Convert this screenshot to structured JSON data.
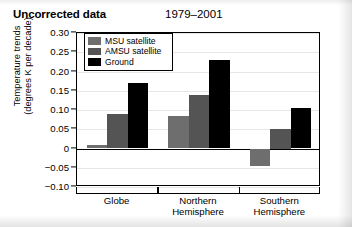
{
  "title": {
    "main": "Uncorrected data",
    "period": "1979–2001"
  },
  "axis": {
    "ylabel_line1": "Temperature trends",
    "ylabel_line2": "(degrees K per decade)"
  },
  "legend": {
    "items": [
      {
        "label": "MSU satellite",
        "color": "#6e6e6e"
      },
      {
        "label": "AMSU satellite",
        "color": "#545454"
      },
      {
        "label": "Ground",
        "color": "#000000"
      }
    ]
  },
  "chart_data": {
    "type": "bar",
    "title": "Uncorrected data",
    "subtitle": "1979–2001",
    "xlabel": "",
    "ylabel": "Temperature trends (degrees K per decade)",
    "categories": [
      "Globe",
      "Northern Hemisphere",
      "Southern Hemisphere"
    ],
    "category_lines": [
      [
        "Globe"
      ],
      [
        "Northern",
        "Hemisphere"
      ],
      [
        "Southern",
        "Hemisphere"
      ]
    ],
    "series": [
      {
        "name": "MSU satellite",
        "color": "#6e6e6e",
        "values": [
          0.01,
          0.085,
          -0.045
        ]
      },
      {
        "name": "AMSU satellite",
        "color": "#545454",
        "values": [
          0.09,
          0.14,
          0.05
        ]
      },
      {
        "name": "Ground",
        "color": "#000000",
        "values": [
          0.17,
          0.23,
          0.105
        ]
      }
    ],
    "ylim": [
      -0.1,
      0.3
    ],
    "yticks": [
      0.3,
      0.25,
      0.2,
      0.15,
      0.1,
      0.05,
      0,
      -0.05,
      -0.1
    ],
    "ytick_labels": [
      "0.30",
      "0.25",
      "0.20",
      "0.15",
      "0.10",
      "0.05",
      "0",
      "−0.05",
      "−0.10"
    ],
    "grid": true,
    "legend_position": "top-left"
  }
}
